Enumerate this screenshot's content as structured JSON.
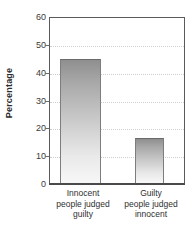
{
  "chart_data": {
    "type": "bar",
    "title": "",
    "subtitle": "",
    "xlabel": "",
    "ylabel": "Percentage",
    "ylim": [
      0,
      60
    ],
    "ytick_values": [
      0,
      10,
      20,
      30,
      40,
      50,
      60
    ],
    "ytick_labels": [
      "0",
      "10",
      "20",
      "30",
      "40",
      "50",
      "60"
    ],
    "grid": true,
    "grid_axis": "y",
    "grid_style": "dotted",
    "legend": false,
    "legend_position": "none",
    "categories": [
      "Innocent people judged guilty",
      "Guilty people judged innocent"
    ],
    "category_lines": [
      [
        "Innocent",
        "people judged",
        "guilty"
      ],
      [
        "Guilty",
        "people judged",
        "innocent"
      ]
    ],
    "values": [
      45,
      16.5
    ],
    "series": [
      {
        "name": "Percentage",
        "values": [
          45,
          16.5
        ]
      }
    ],
    "bar_style": {
      "fill": "vertical-gradient",
      "gradient_top_color": "#8f8f8f",
      "gradient_bottom_color": "#f7f7f7",
      "edge_color": "#7d7d7d"
    },
    "colors": {
      "axis": "#5a5a5a",
      "baseline": "#4a4a4a",
      "gridline": "#cfcfcf",
      "text": "#2f2f2f",
      "background": "#ffffff"
    }
  }
}
